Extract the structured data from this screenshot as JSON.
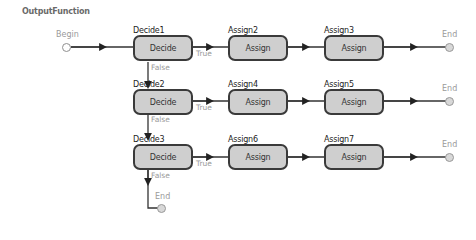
{
  "diagram": {
    "title": "OutputFunction",
    "begin": {
      "label": "Begin"
    },
    "rows": [
      {
        "decide": {
          "name": "Decide1",
          "label": "Decide",
          "true_label": "True",
          "false_label": "False"
        },
        "assigns": [
          {
            "name": "Assign2",
            "label": "Assign"
          },
          {
            "name": "Assign3",
            "label": "Assign"
          }
        ],
        "end_label": "End"
      },
      {
        "decide": {
          "name": "Decide2",
          "label": "Decide",
          "true_label": "True",
          "false_label": "False"
        },
        "assigns": [
          {
            "name": "Assign4",
            "label": "Assign"
          },
          {
            "name": "Assign5",
            "label": "Assign"
          }
        ],
        "end_label": "End"
      },
      {
        "decide": {
          "name": "Decide3",
          "label": "Decide",
          "true_label": "True",
          "false_label": "False"
        },
        "assigns": [
          {
            "name": "Assign6",
            "label": "Assign"
          },
          {
            "name": "Assign7",
            "label": "Assign"
          }
        ],
        "end_label": "End"
      }
    ],
    "final_end_label": "End",
    "colors": {
      "node_fill": "#cfcfcf",
      "node_border": "#3a3a3a",
      "wire": "#333333",
      "muted_text": "#9a9a9a"
    }
  }
}
